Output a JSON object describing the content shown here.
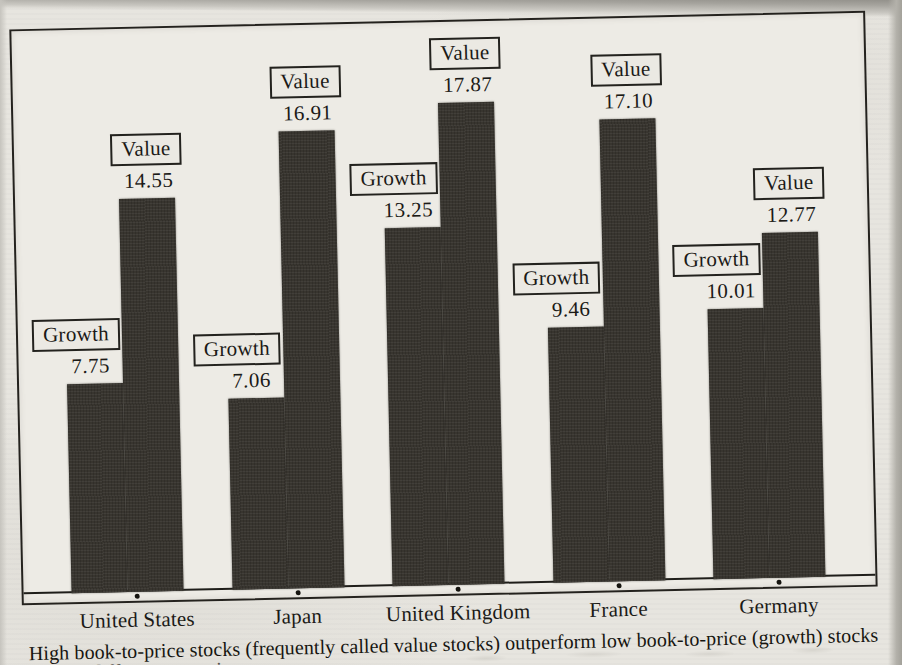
{
  "page": {
    "caption": "High book-to-price stocks (frequently called value stocks) outperform low book-to-price (growth) stocks",
    "caption_line2": "in different countries"
  },
  "chart_data": {
    "type": "bar",
    "title": "",
    "categories": [
      "United States",
      "Japan",
      "United Kingdom",
      "France",
      "Germany"
    ],
    "series": [
      {
        "name": "Growth",
        "values": [
          7.75,
          7.06,
          13.25,
          9.46,
          10.01
        ],
        "labels": [
          "7.75",
          "7.06",
          "13.25",
          "9.46",
          "10.01"
        ]
      },
      {
        "name": "Value",
        "values": [
          14.55,
          16.91,
          17.87,
          17.1,
          12.77
        ],
        "labels": [
          "14.55",
          "16.91",
          "17.87",
          "17.10",
          "12.77"
        ]
      }
    ],
    "ylim": [
      0,
      20
    ],
    "y_axis_visible": false,
    "grid": false,
    "legend_position": "none",
    "bar_color": "#38352f",
    "x_tick_marker": "dot",
    "annotation_style": "boxed series name with value beneath, above each bar"
  }
}
